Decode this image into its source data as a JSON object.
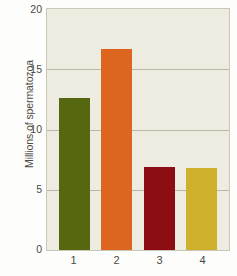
{
  "chart_data": {
    "type": "bar",
    "title": "",
    "subtitle": "",
    "xlabel": "",
    "ylabel": "Millions of spermatozoa",
    "categories": [
      "1",
      "2",
      "3",
      "4"
    ],
    "values": [
      12.6,
      16.7,
      6.9,
      6.8
    ],
    "series": [
      {
        "name": "Millions of spermatozoa",
        "values": [
          12.6,
          16.7,
          6.9,
          6.8
        ]
      }
    ],
    "bar_colors": [
      "#55680f",
      "#dc6520",
      "#8c0d13",
      "#cfb02a"
    ],
    "ylim": [
      0,
      20
    ],
    "yticks": [
      0,
      5,
      10,
      15,
      20
    ],
    "ytick_labels": [
      "0",
      "5",
      "10",
      "15",
      "20"
    ],
    "xtick_labels": [
      "1",
      "2",
      "3",
      "4"
    ],
    "grid": true,
    "grid_axis": "y",
    "legend": false,
    "legend_position": "none",
    "plot_background": "#eeece1",
    "figure_background": "#fdfdfb",
    "grid_color": "#b9b8a6",
    "axis_text_color": "#4a4a45"
  }
}
